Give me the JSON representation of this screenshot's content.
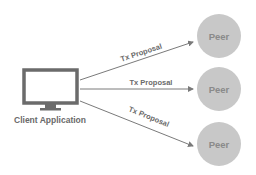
{
  "diagram": {
    "client": {
      "label": "Client Application",
      "icon": "monitor-icon"
    },
    "peers": [
      {
        "label": "Peer"
      },
      {
        "label": "Peer"
      },
      {
        "label": "Peer"
      }
    ],
    "arrows": [
      {
        "label": "Tx Proposal",
        "from": "client",
        "to": "peer-1"
      },
      {
        "label": "Tx Proposal",
        "from": "client",
        "to": "peer-2"
      },
      {
        "label": "Tx Proposal",
        "from": "client",
        "to": "peer-3"
      }
    ],
    "colors": {
      "monitor_frame": "#6b6b6b",
      "peer_fill": "#c8c8c8",
      "peer_text": "#8a8a8a",
      "arrow": "#7a7a7a",
      "label_text": "#6a6a6a"
    }
  }
}
